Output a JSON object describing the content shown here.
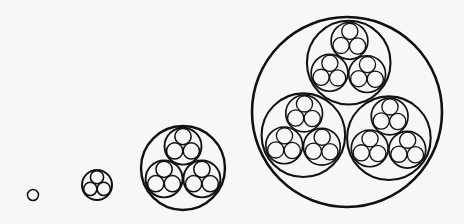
{
  "diagram": {
    "colors": {
      "background": "#f7f7f7",
      "stroke": "#111111"
    },
    "child_ratio": 0.44,
    "child_offset_ratio": 0.52,
    "stages": [
      {
        "depth": 0,
        "cx": 33,
        "cy": 195,
        "r": 5.5,
        "stroke_width": 2.0,
        "rotation_deg": 0
      },
      {
        "depth": 1,
        "cx": 97,
        "cy": 185,
        "r": 15,
        "stroke_width": 2.0,
        "rotation_deg": 0
      },
      {
        "depth": 2,
        "cx": 183,
        "cy": 168,
        "r": 42,
        "stroke_width": 2.4,
        "rotation_deg": 0
      },
      {
        "depth": 3,
        "cx": 347,
        "cy": 112,
        "r": 95,
        "stroke_width": 2.6,
        "rotation_deg": 2
      }
    ]
  }
}
